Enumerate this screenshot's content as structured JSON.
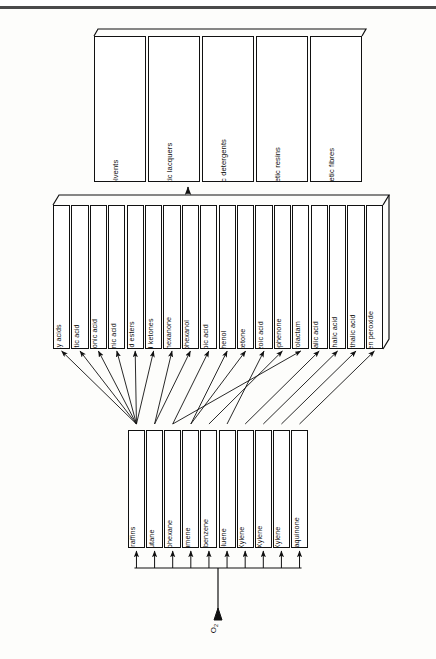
{
  "diagram": {
    "orientation": "rotated-90-ccw",
    "feed": {
      "name": "oxygen-feed",
      "label": "O",
      "subscript": "2"
    },
    "feedstocks": {
      "name": "hydrocarbon-feedstocks",
      "items": [
        {
          "label": "Paraffins"
        },
        {
          "label": "Butane"
        },
        {
          "label": "Cyclohexane"
        },
        {
          "label": "Cumene"
        },
        {
          "label": "Ethylbenzene"
        },
        {
          "label": "Toluene"
        },
        {
          "label": "o-Xylene"
        },
        {
          "label": "m-Xylene"
        },
        {
          "label": "p-Xylene"
        },
        {
          "label": "Anthraquinone"
        }
      ]
    },
    "intermediates": {
      "name": "oxidation-products",
      "items": [
        {
          "label": "Fatty acids"
        },
        {
          "label": "Acetic acid"
        },
        {
          "label": "Propionic acid"
        },
        {
          "label": "Formic acid"
        },
        {
          "label": "Mixed esters"
        },
        {
          "label": "Mixed ketones"
        },
        {
          "label": "Cyclohexanone"
        },
        {
          "label": "Cyclohexanol"
        },
        {
          "label": "Adipic acid"
        },
        {
          "label": "Phenol"
        },
        {
          "label": "Acetone"
        },
        {
          "label": "Benzoic acid"
        },
        {
          "label": "Acetophenone"
        },
        {
          "label": "Caprolactam"
        },
        {
          "label": "Phthalic acid"
        },
        {
          "label": "Isophthalic acid"
        },
        {
          "label": "Terephthalic acid"
        },
        {
          "label": "Hydrogen peroxide"
        }
      ]
    },
    "endproducts": {
      "name": "end-products",
      "items": [
        {
          "label": "Solvents"
        },
        {
          "label": "Synthetic lacquers"
        },
        {
          "label": "Synthetic detergents"
        },
        {
          "label": "Synthetic resins"
        },
        {
          "label": "Synthetic fibres"
        }
      ]
    },
    "colors": {
      "line": "#111111",
      "fill": "#ffffff",
      "page": "#fdfdfb"
    }
  }
}
